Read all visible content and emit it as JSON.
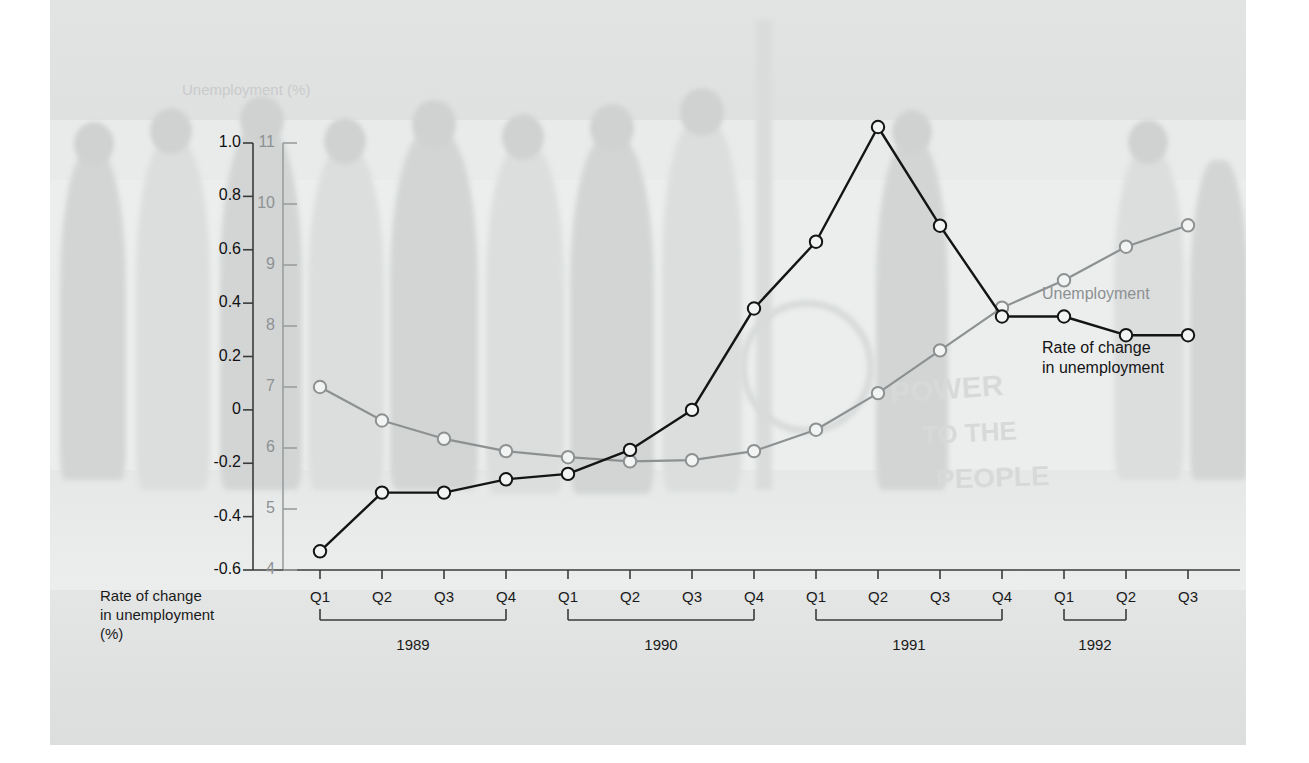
{
  "figure": {
    "background_note": "faded photograph of a crowd in a street behind the chart",
    "graffiti": [
      "POWER",
      "TO THE",
      "PEOPLE"
    ]
  },
  "colors": {
    "unemployment_line": "#8d9192",
    "rate_line": "#141414",
    "marker_fill": "#f2f3f3",
    "panel": "#eceeee",
    "text": "#1a1a1a",
    "gray_text": "#8d9192"
  },
  "chart_data": {
    "type": "line",
    "title": "",
    "xlabel": "",
    "grid": false,
    "legend": "inline",
    "axes": {
      "left": {
        "label": "Rate of change in unemployment (%)",
        "ticks": [
          "1.0",
          "0.8",
          "0.6",
          "0.4",
          "0.2",
          "0",
          "-0.2",
          "-0.4",
          "-0.6"
        ],
        "tick_values": [
          1.0,
          0.8,
          0.6,
          0.4,
          0.2,
          0,
          -0.2,
          -0.4,
          -0.6
        ],
        "ylim": [
          -0.6,
          1.0
        ]
      },
      "right": {
        "label": "Unemployment (%)",
        "ticks": [
          "11",
          "10",
          "9",
          "8",
          "7",
          "6",
          "5",
          "4"
        ],
        "tick_values": [
          11,
          10,
          9,
          8,
          7,
          6,
          5,
          4
        ],
        "ylim": [
          4,
          11
        ]
      }
    },
    "x": [
      "Q1",
      "Q2",
      "Q3",
      "Q4",
      "Q1",
      "Q2",
      "Q3",
      "Q4",
      "Q1",
      "Q2",
      "Q3",
      "Q4",
      "Q1",
      "Q2",
      "Q3"
    ],
    "year_groups": [
      {
        "label": "1989",
        "start": 0,
        "end": 3
      },
      {
        "label": "1990",
        "start": 4,
        "end": 7
      },
      {
        "label": "1991",
        "start": 8,
        "end": 11
      },
      {
        "label": "1992",
        "start": 12,
        "end": 13
      }
    ],
    "series": [
      {
        "name": "Unemployment",
        "axis": "right",
        "color": "#8d9192",
        "values": [
          7.0,
          6.45,
          6.15,
          5.95,
          5.85,
          5.78,
          5.8,
          5.95,
          6.3,
          6.9,
          7.6,
          8.3,
          8.75,
          9.3,
          9.65
        ]
      },
      {
        "name": "Rate of change in unemployment",
        "axis": "left",
        "color": "#141414",
        "values": [
          -0.53,
          -0.31,
          -0.31,
          -0.26,
          -0.24,
          -0.15,
          0.0,
          0.38,
          0.63,
          1.06,
          0.69,
          0.35,
          0.35,
          0.28,
          0.28
        ]
      }
    ],
    "annotations": [
      {
        "text": "Unemployment",
        "series": "Unemployment"
      },
      {
        "text": "Rate of change in unemployment",
        "series": "Rate of change in unemployment"
      }
    ]
  }
}
